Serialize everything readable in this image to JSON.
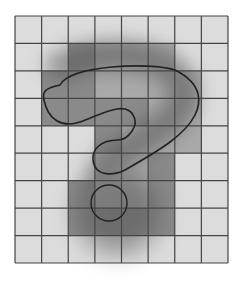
{
  "figure": {
    "grid": {
      "cols": 8,
      "rows": 9,
      "x0": 15,
      "y0": 16,
      "x1": 228,
      "y1": 263
    },
    "colors": {
      "background": "#ffffff",
      "cell_light": "#dcdcdc",
      "cell_mid": "#a9a9a9",
      "cell_dark": "#8a8a8a",
      "grid_line": "#444444",
      "outline": "#222222",
      "shadow": "#555555"
    },
    "filled_cells": [
      {
        "col": 2,
        "row": 1,
        "tone": "dark"
      },
      {
        "col": 3,
        "row": 1,
        "tone": "mid"
      },
      {
        "col": 4,
        "row": 1,
        "tone": "mid"
      },
      {
        "col": 5,
        "row": 1,
        "tone": "mid"
      },
      {
        "col": 1,
        "row": 2,
        "tone": "dark"
      },
      {
        "col": 2,
        "row": 2,
        "tone": "dark"
      },
      {
        "col": 3,
        "row": 2,
        "tone": "mid"
      },
      {
        "col": 4,
        "row": 2,
        "tone": "mid"
      },
      {
        "col": 5,
        "row": 2,
        "tone": "mid"
      },
      {
        "col": 6,
        "row": 2,
        "tone": "mid"
      },
      {
        "col": 1,
        "row": 3,
        "tone": "dark"
      },
      {
        "col": 2,
        "row": 3,
        "tone": "dark"
      },
      {
        "col": 3,
        "row": 3,
        "tone": "dark"
      },
      {
        "col": 4,
        "row": 3,
        "tone": "dark"
      },
      {
        "col": 5,
        "row": 3,
        "tone": "mid"
      },
      {
        "col": 6,
        "row": 3,
        "tone": "mid"
      },
      {
        "col": 3,
        "row": 4,
        "tone": "dark"
      },
      {
        "col": 4,
        "row": 4,
        "tone": "mid"
      },
      {
        "col": 5,
        "row": 4,
        "tone": "mid"
      },
      {
        "col": 6,
        "row": 4,
        "tone": "mid"
      },
      {
        "col": 3,
        "row": 5,
        "tone": "mid"
      },
      {
        "col": 4,
        "row": 5,
        "tone": "mid"
      },
      {
        "col": 5,
        "row": 5,
        "tone": "dark"
      },
      {
        "col": 2,
        "row": 6,
        "tone": "dark"
      },
      {
        "col": 3,
        "row": 6,
        "tone": "mid"
      },
      {
        "col": 4,
        "row": 6,
        "tone": "mid"
      },
      {
        "col": 5,
        "row": 6,
        "tone": "dark"
      },
      {
        "col": 2,
        "row": 7,
        "tone": "dark"
      },
      {
        "col": 3,
        "row": 7,
        "tone": "dark"
      },
      {
        "col": 4,
        "row": 7,
        "tone": "dark"
      },
      {
        "col": 5,
        "row": 7,
        "tone": "dark"
      }
    ]
  }
}
